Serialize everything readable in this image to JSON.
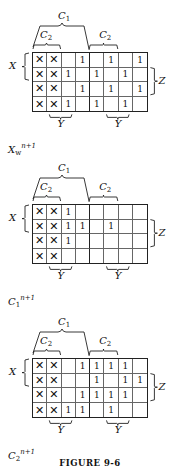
{
  "maps": [
    {
      "name": "Xw^(n+1)",
      "title_base": "X",
      "title_sub": "w",
      "title_sup": "n+1",
      "labels": {
        "C1": "C",
        "C1_sub": "1",
        "C2": "C",
        "C2_sub": "2",
        "X": "X",
        "Y": "Y",
        "Z": "Z"
      },
      "rows": [
        [
          "✕",
          "✕",
          "",
          "1",
          "",
          "1",
          "",
          "1"
        ],
        [
          "✕",
          "✕",
          "1",
          "",
          "1",
          "",
          "1",
          ""
        ],
        [
          "✕",
          "✕",
          "",
          "1",
          "",
          "1",
          "",
          "1"
        ],
        [
          "✕",
          "✕",
          "1",
          "",
          "1",
          "",
          "1",
          ""
        ]
      ]
    },
    {
      "name": "C1^(n+1)",
      "title_base": "C",
      "title_sub": "1",
      "title_sup": "n+1",
      "labels": {
        "C1": "C",
        "C1_sub": "1",
        "C2": "C",
        "C2_sub": "2",
        "X": "X",
        "Y": "Y",
        "Z": "Z"
      },
      "rows": [
        [
          "✕",
          "✕",
          "1",
          "",
          "",
          "",
          "",
          ""
        ],
        [
          "✕",
          "✕",
          "1",
          "1",
          "",
          "1",
          "",
          ""
        ],
        [
          "✕",
          "✕",
          "1",
          "",
          "",
          "",
          "",
          ""
        ],
        [
          "✕",
          "✕",
          "",
          "",
          "",
          "",
          "",
          ""
        ]
      ]
    },
    {
      "name": "C2^(n+1)",
      "title_base": "C",
      "title_sub": "2",
      "title_sup": "n+1",
      "labels": {
        "C1": "C",
        "C1_sub": "1",
        "C2": "C",
        "C2_sub": "2",
        "X": "X",
        "Y": "Y",
        "Z": "Z"
      },
      "rows": [
        [
          "✕",
          "✕",
          "",
          "1",
          "1",
          "1",
          "1",
          ""
        ],
        [
          "✕",
          "✕",
          "",
          "",
          "1",
          "",
          "1",
          "1"
        ],
        [
          "✕",
          "✕",
          "",
          "1",
          "1",
          "1",
          "1",
          ""
        ],
        [
          "✕",
          "✕",
          "1",
          "1",
          "",
          "1",
          "",
          ""
        ]
      ]
    }
  ],
  "caption": "FIGURE 9-6"
}
